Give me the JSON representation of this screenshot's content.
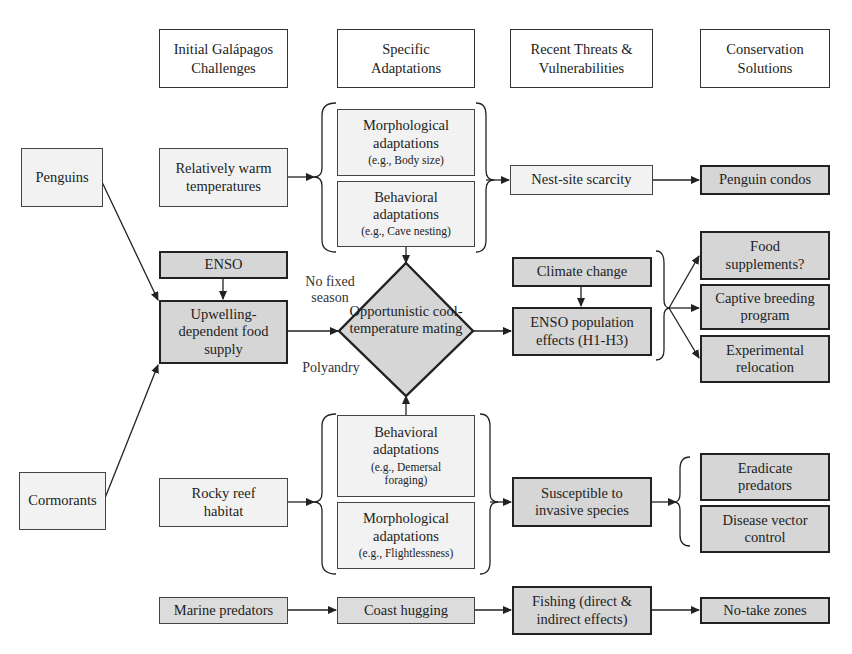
{
  "headers": {
    "col1": "Initial Galápagos Challenges",
    "col2": "Specific Adaptations",
    "col3": "Recent Threats & Vulnerabilities",
    "col4": "Conservation Solutions"
  },
  "species": {
    "penguins": "Penguins",
    "cormorants": "Cormorants"
  },
  "challenges": {
    "warm_temps": "Relatively warm temperatures",
    "enso": "ENSO",
    "upwelling": "Upwelling-dependent food supply",
    "rocky_reef": "Rocky reef habitat",
    "marine_predators": "Marine predators"
  },
  "adaptations": {
    "penguin_morph": {
      "title": "Morphological adaptations",
      "example": "(e.g., Body size)"
    },
    "penguin_behav": {
      "title": "Behavioral adaptations",
      "example": "(e.g., Cave nesting)"
    },
    "cormorant_behav": {
      "title": "Behavioral adaptations",
      "example": "(e.g., Demersal foraging)"
    },
    "cormorant_morph": {
      "title": "Morphological adaptations",
      "example": "(e.g., Flightlessness)"
    },
    "mating": "Opportunistic cool-temperature mating",
    "coast_hugging": "Coast hugging",
    "no_fixed_season": "No fixed season",
    "polyandry": "Polyandry"
  },
  "threats": {
    "nest_site": "Nest-site scarcity",
    "climate_change": "Climate change",
    "enso_effects": "ENSO population effects (H1-H3)",
    "invasive": "Susceptible to invasive species",
    "fishing": "Fishing (direct & indirect effects)"
  },
  "solutions": {
    "penguin_condos": "Penguin condos",
    "food_supplements": "Food supplements?",
    "captive_breeding": "Captive breeding program",
    "relocation": "Experimental relocation",
    "eradicate": "Eradicate predators",
    "disease": "Disease vector control",
    "no_take": "No-take zones"
  },
  "colors": {
    "dark_fill": "#d6d6d6",
    "light_fill": "#f2f2f2",
    "line": "#222222"
  }
}
